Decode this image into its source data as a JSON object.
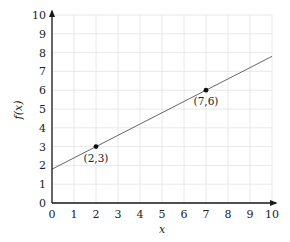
{
  "chart_data": {
    "type": "line",
    "title": "",
    "xlabel": "x",
    "ylabel": "f(x)",
    "xlim": [
      0,
      10
    ],
    "ylim": [
      0,
      10
    ],
    "grid": true,
    "x_ticks": [
      "0",
      "1",
      "2",
      "3",
      "4",
      "5",
      "6",
      "7",
      "8",
      "9",
      "10"
    ],
    "y_ticks": [
      "0",
      "1",
      "2",
      "3",
      "4",
      "5",
      "6",
      "7",
      "8",
      "9",
      "10"
    ],
    "series": [
      {
        "name": "f(x) = 0.6x + 1.8",
        "x": [
          0,
          10
        ],
        "y": [
          1.8,
          7.8
        ],
        "color": "#555555"
      }
    ],
    "points": [
      {
        "x": 2,
        "y": 3,
        "label": "(2,3)"
      },
      {
        "x": 7,
        "y": 6,
        "label": "(7,6)"
      }
    ],
    "colors": {
      "grid": "#e2e2e2",
      "axis": "#1a1a1a",
      "line": "#555555",
      "point": "#111111"
    }
  }
}
